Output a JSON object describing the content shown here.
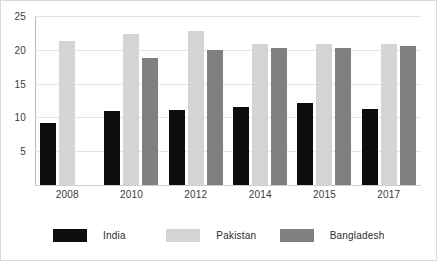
{
  "chart_data": {
    "type": "bar",
    "title": "",
    "subtitle": "",
    "xlabel": "",
    "ylabel": "",
    "categories": [
      "2008",
      "2010",
      "2012",
      "2014",
      "2015",
      "2017"
    ],
    "series": [
      {
        "name": "India",
        "color": "#0d0d0d",
        "values": [
          9.2,
          10.9,
          11.1,
          11.6,
          12.1,
          11.2
        ]
      },
      {
        "name": "Pakistan",
        "color": "#d4d4d4",
        "values": [
          21.3,
          22.4,
          22.8,
          20.9,
          20.9,
          20.9
        ]
      },
      {
        "name": "Bangladesh",
        "color": "#808080",
        "values": [
          null,
          18.8,
          19.9,
          20.2,
          20.2,
          20.5
        ]
      }
    ],
    "ylim": [
      0,
      25
    ],
    "ytick_labels": [
      "25",
      "20",
      "15",
      "10",
      "5"
    ],
    "ytick_values": [
      25,
      20,
      15,
      10,
      5
    ],
    "grid": true,
    "legend_position": "bottom"
  },
  "legend": {
    "items": [
      {
        "label": "India",
        "color": "#0d0d0d"
      },
      {
        "label": "Pakistan",
        "color": "#d4d4d4"
      },
      {
        "label": "Bangladesh",
        "color": "#808080"
      }
    ]
  },
  "colors": {
    "frame_border": "#d9d9d9",
    "gridline": "#e4e4e4",
    "axis_line": "#b8b8b8",
    "tick_text": "#3b3b3b",
    "background": "#ffffff"
  }
}
